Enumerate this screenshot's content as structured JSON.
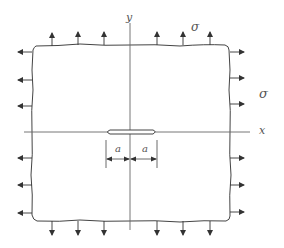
{
  "figure": {
    "axes": {
      "x_label": "x",
      "y_label": "y"
    },
    "stress_labels": {
      "top": "σ",
      "right": "σ"
    },
    "crack": {
      "half_length_label_left": "a",
      "half_length_label_right": "a"
    },
    "colors": {
      "stroke": "#444444",
      "background": "#ffffff"
    },
    "plate": {
      "left": 32,
      "top": 45,
      "right": 230,
      "bottom": 221
    },
    "arrows": {
      "top_x": [
        52,
        78,
        104,
        157,
        183,
        210
      ],
      "bottom_x": [
        52,
        78,
        104,
        157,
        183,
        210
      ],
      "left_y": [
        52,
        80,
        106,
        158,
        185,
        213
      ],
      "right_y": [
        52,
        78,
        104,
        158,
        185,
        212
      ]
    }
  }
}
